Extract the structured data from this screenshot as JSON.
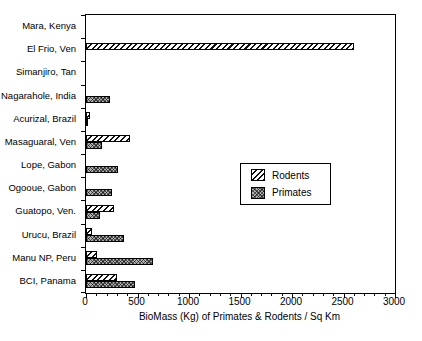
{
  "chart_data": {
    "type": "bar",
    "orientation": "horizontal",
    "title": "",
    "xlabel": "BioMass (Kg) of Primates & Rodents / Sq Km",
    "ylabel": "",
    "xlim": [
      0,
      3000
    ],
    "x_ticks": [
      0,
      500,
      1000,
      1500,
      2000,
      2500,
      3000
    ],
    "x_minor_tick_step": 100,
    "grid": false,
    "categories": [
      "Mara, Kenya",
      "El Frio, Ven",
      "Simanjiro, Tan",
      "Nagarahole, India",
      "Acurizal, Brazil",
      "Masaguaral, Ven",
      "Lope, Gabon",
      "Ogooue, Gabon",
      "Guatopo, Ven.",
      "Urucu, Brazil",
      "Manu NP, Peru",
      "BCI, Panama"
    ],
    "series": [
      {
        "name": "Rodents",
        "pattern": "diagonal-hatch",
        "values": [
          0,
          2600,
          0,
          0,
          35,
          430,
          0,
          0,
          270,
          55,
          110,
          300
        ]
      },
      {
        "name": "Primates",
        "pattern": "crosshatch",
        "values": [
          0,
          0,
          0,
          230,
          20,
          160,
          310,
          250,
          135,
          370,
          650,
          480
        ]
      }
    ],
    "legend": {
      "position": "middle-right",
      "entries": [
        "Rodents",
        "Primates"
      ]
    },
    "colors": {
      "axis": "#000000",
      "background": "#ffffff",
      "bar_outline": "#000000",
      "crosshatch_fill": "#aeaeae"
    }
  }
}
